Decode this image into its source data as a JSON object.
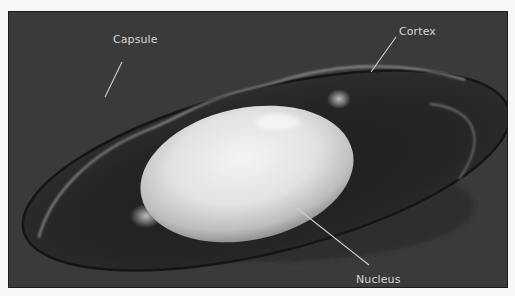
{
  "figure": {
    "colors": {
      "background": "#3a3a3a",
      "lens_body": "#262626",
      "capsule_edge": "#1a1a1a",
      "cortex_line": "#9a9a9a",
      "nucleus_light": "#f2f2f2",
      "nucleus_dark": "#8a8a8a",
      "leader_line": "#cfcfcf",
      "label_text": "#d6d6d6"
    },
    "labels": [
      {
        "id": "capsule",
        "text": "Capsule",
        "x": 104,
        "y": 21
      },
      {
        "id": "cortex",
        "text": "Cortex",
        "x": 390,
        "y": 13
      },
      {
        "id": "nucleus",
        "text": "Nucleus",
        "x": 347,
        "y": 261
      }
    ]
  }
}
